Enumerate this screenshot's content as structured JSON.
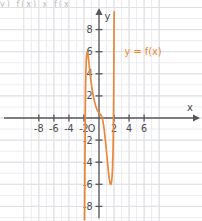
{
  "figure": {
    "background_color": "#ffffff",
    "grid_color": "#dfdfe4",
    "grid_color_minor": "#ededf1",
    "axis_color": "#58585c",
    "curve_color": "#e8883c",
    "label_color": "#4a4a4e",
    "cropped_header_text": "y)    f(x)       x        f(x"
  },
  "chart_data": {
    "type": "line",
    "title": "",
    "subtitle": "",
    "xlabel": "x",
    "ylabel": "y",
    "legend_position": "upper-right-inside",
    "grid": true,
    "xlim": [
      -8.8,
      7.6
    ],
    "ylim": [
      -8.8,
      9.4
    ],
    "xticks": [
      -8,
      -6,
      -4,
      -2,
      2,
      4,
      6
    ],
    "yticks": [
      8,
      6,
      4,
      2,
      -2,
      -4,
      -6,
      -8
    ],
    "xtick_labels": [
      "-8",
      "-6",
      "-4",
      "-2",
      "2",
      "4",
      "6"
    ],
    "ytick_labels": [
      "8",
      "6",
      "4",
      "2",
      "-2",
      "-4",
      "-6",
      "-8"
    ],
    "origin_label": "O",
    "tick_step": 2,
    "grid_step": 1,
    "series": [
      {
        "name": "y = f(x)",
        "color": "#e8883c",
        "annotation": "y = f(x)",
        "annotation_x": 3.4,
        "annotation_y": 6.0,
        "x": [
          -1.92,
          -1.9,
          -1.88,
          -1.85,
          -1.82,
          -1.78,
          -1.74,
          -1.7,
          -1.65,
          -1.6,
          -1.55,
          -1.5,
          -1.45,
          -1.4,
          -1.32,
          -1.24,
          -1.16,
          -1.08,
          -1.0,
          -0.92,
          -0.84,
          -0.76,
          -0.68,
          -0.6,
          -0.52,
          -0.44,
          -0.36,
          -0.28,
          -0.2,
          -0.12,
          -0.04,
          0.04,
          0.12,
          0.2,
          0.28,
          0.36,
          0.44,
          0.52,
          0.6,
          0.7,
          0.8,
          0.9,
          1.0,
          1.1,
          1.2,
          1.3,
          1.38,
          1.46,
          1.52,
          1.58,
          1.64,
          1.7,
          1.75,
          1.8,
          1.85,
          1.88,
          1.91,
          1.94,
          1.96,
          1.98,
          2.0,
          2.02
        ],
        "y": [
          -9.2,
          -7.6,
          -5.4,
          -2.2,
          0.6,
          2.9,
          4.2,
          5.1,
          5.7,
          5.95,
          6.0,
          5.92,
          5.7,
          5.4,
          4.9,
          4.35,
          3.85,
          3.4,
          3.0,
          2.62,
          2.3,
          2.0,
          1.74,
          1.5,
          1.3,
          1.1,
          0.94,
          0.8,
          0.68,
          0.58,
          0.5,
          0.44,
          0.38,
          0.32,
          0.24,
          0.12,
          -0.05,
          -0.3,
          -0.62,
          -1.1,
          -1.7,
          -2.35,
          -3.05,
          -3.8,
          -4.5,
          -5.2,
          -5.6,
          -5.88,
          -5.98,
          -6.0,
          -5.9,
          -5.6,
          -5.2,
          -4.5,
          -3.4,
          -2.5,
          -1.2,
          0.8,
          2.6,
          5.4,
          8.2,
          9.6
        ],
        "vertical_asymptotes": [
          -1.93,
          2.03
        ],
        "local_maximum": {
          "x": -1.55,
          "y": 6.0
        },
        "local_minimum": {
          "x": 1.58,
          "y": -6.0
        }
      }
    ]
  }
}
